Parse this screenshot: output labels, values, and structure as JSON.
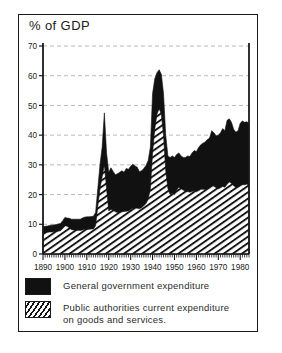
{
  "figure": {
    "title": "% of GDP",
    "colors": {
      "ink": "#1a1a1a",
      "solid_series": "#111111",
      "hatch_series": "#ffffff",
      "gridline": "#9a9a9a",
      "background": "#ffffff"
    }
  },
  "legend": {
    "position": "below-plot",
    "items": [
      {
        "label": "General government expenditure",
        "swatch": "solid-black-swatch"
      },
      {
        "label": "Public authorities current expenditure on goods and services.",
        "swatch": "diagonal-hatch-swatch"
      }
    ]
  },
  "axes": {
    "y_label": "% of GDP",
    "y_ticks": [
      "0",
      "10",
      "20",
      "30",
      "40",
      "50",
      "60",
      "70"
    ],
    "x_ticks": [
      "1890",
      "1900",
      "1910",
      "1920",
      "1930",
      "1940",
      "1950",
      "1960",
      "1970",
      "1980"
    ]
  },
  "chart_data": {
    "type": "area",
    "title": "% of GDP",
    "xlabel": "",
    "ylabel": "% of GDP",
    "xlim": [
      1890,
      1984
    ],
    "ylim": [
      0,
      70
    ],
    "ytick_step": 10,
    "xtick_step": 10,
    "grid": true,
    "grid_axis": "y",
    "grid_style": "dashed",
    "stacked": true,
    "legend_position": "below",
    "x": [
      1890,
      1891,
      1892,
      1893,
      1894,
      1895,
      1896,
      1897,
      1898,
      1899,
      1900,
      1901,
      1902,
      1903,
      1904,
      1905,
      1906,
      1907,
      1908,
      1909,
      1910,
      1911,
      1912,
      1913,
      1914,
      1915,
      1916,
      1917,
      1918,
      1919,
      1920,
      1921,
      1922,
      1923,
      1924,
      1925,
      1926,
      1927,
      1928,
      1929,
      1930,
      1931,
      1932,
      1933,
      1934,
      1935,
      1936,
      1937,
      1938,
      1939,
      1940,
      1941,
      1942,
      1943,
      1944,
      1945,
      1946,
      1947,
      1948,
      1949,
      1950,
      1951,
      1952,
      1953,
      1954,
      1955,
      1956,
      1957,
      1958,
      1959,
      1960,
      1961,
      1962,
      1963,
      1964,
      1965,
      1966,
      1967,
      1968,
      1969,
      1970,
      1971,
      1972,
      1973,
      1974,
      1975,
      1976,
      1977,
      1978,
      1979,
      1980,
      1981,
      1982,
      1983,
      1984
    ],
    "series": [
      {
        "name": "Public authorities current expenditure on goods and services.",
        "fill": "diagonal-hatch",
        "values": [
          7.0,
          7.1,
          7.3,
          7.4,
          7.4,
          7.5,
          7.6,
          7.7,
          7.8,
          8.6,
          9.6,
          9.3,
          8.8,
          8.2,
          8.1,
          8.0,
          8.0,
          7.9,
          8.1,
          8.3,
          8.3,
          8.3,
          8.4,
          8.4,
          9.5,
          16.0,
          22.0,
          26.0,
          30.0,
          22.0,
          14.5,
          15.0,
          14.8,
          14.2,
          14.0,
          14.0,
          14.2,
          14.3,
          14.4,
          14.5,
          15.0,
          15.4,
          15.6,
          15.4,
          15.2,
          15.6,
          16.2,
          17.0,
          18.5,
          22.0,
          34.0,
          42.0,
          47.0,
          49.0,
          47.0,
          40.0,
          28.0,
          22.0,
          20.0,
          20.5,
          20.0,
          21.5,
          22.5,
          22.0,
          21.5,
          21.0,
          21.0,
          20.8,
          21.0,
          21.3,
          21.0,
          21.3,
          21.8,
          21.8,
          21.7,
          22.0,
          22.2,
          23.0,
          22.8,
          22.3,
          22.0,
          22.3,
          22.7,
          22.5,
          23.5,
          24.2,
          23.8,
          23.0,
          22.5,
          22.5,
          23.0,
          23.3,
          23.3,
          23.5,
          23.2
        ]
      },
      {
        "name": "General government expenditure",
        "fill": "solid-black",
        "values": [
          2.2,
          2.2,
          2.1,
          2.2,
          2.3,
          2.3,
          2.3,
          2.4,
          2.5,
          2.6,
          2.7,
          2.8,
          3.2,
          3.5,
          3.6,
          3.7,
          3.7,
          3.8,
          4.0,
          4.1,
          4.2,
          4.2,
          4.2,
          4.3,
          4.5,
          6.0,
          8.0,
          10.0,
          17.5,
          12.0,
          13.0,
          14.0,
          13.0,
          12.5,
          13.0,
          13.5,
          13.8,
          13.2,
          14.4,
          14.0,
          14.5,
          14.8,
          14.0,
          13.8,
          12.5,
          12.4,
          12.6,
          12.8,
          13.0,
          14.0,
          20.0,
          17.0,
          14.0,
          13.0,
          13.5,
          14.0,
          12.0,
          11.0,
          12.5,
          12.5,
          12.5,
          12.0,
          11.5,
          11.0,
          11.0,
          11.5,
          12.0,
          12.0,
          13.0,
          13.5,
          13.5,
          14.5,
          15.0,
          15.5,
          16.0,
          16.5,
          16.8,
          18.5,
          18.0,
          17.5,
          18.0,
          18.5,
          19.5,
          19.0,
          21.5,
          21.3,
          20.5,
          19.0,
          18.5,
          19.0,
          21.0,
          21.5,
          21.0,
          21.0,
          20.8
        ]
      }
    ],
    "annotations": [
      {
        "text": "WWI peak",
        "x": 1918,
        "y": 47.5
      },
      {
        "text": "WWII peak",
        "x": 1943,
        "y": 62.0
      }
    ]
  }
}
